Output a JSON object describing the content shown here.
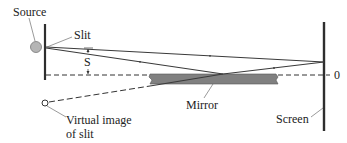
{
  "diagram": {
    "labels": {
      "source": "Source",
      "slit": "Slit",
      "s": "S",
      "zero": "0",
      "mirror": "Mirror",
      "virtual_image_line1": "Virtual image",
      "virtual_image_line2": "of slit",
      "screen": "Screen"
    },
    "colors": {
      "line": "#3a3a3a",
      "mirror_fill": "#808080",
      "source_fill": "#b5b5b5",
      "text": "#222222"
    }
  }
}
